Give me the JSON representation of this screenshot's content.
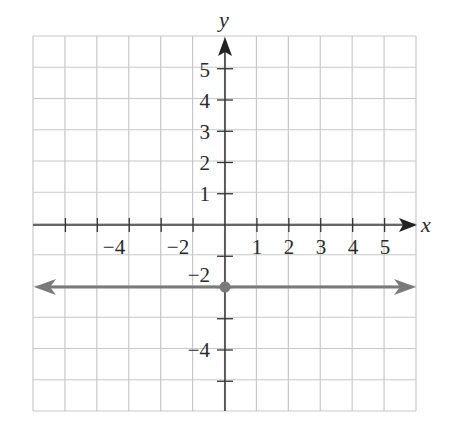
{
  "chart_data": {
    "type": "line",
    "title": "",
    "xlabel": "x",
    "ylabel": "y",
    "xlim": [
      -6,
      6
    ],
    "ylim": [
      -6,
      6
    ],
    "grid": true,
    "x_tick_labels": [
      "-4",
      "-2",
      "1",
      "2",
      "3",
      "4",
      "5"
    ],
    "x_tick_values": [
      -4,
      -2,
      1,
      2,
      3,
      4,
      5
    ],
    "y_tick_labels": [
      "5",
      "4",
      "3",
      "2",
      "1",
      "-2",
      "-4"
    ],
    "y_tick_values": [
      5,
      4,
      3,
      2,
      1,
      -2,
      -4
    ],
    "series": [
      {
        "name": "y = -2",
        "equation": "y = -2",
        "kind": "horizontal line with arrows at both ends",
        "x": [
          -6,
          6
        ],
        "y": [
          -2,
          -2
        ],
        "color": "#7a7a7a"
      }
    ],
    "points": [
      {
        "label": "y-intercept",
        "x": 0,
        "y": -2,
        "color": "#7a7a7a"
      }
    ]
  },
  "labels": {
    "x_axis": "x",
    "y_axis": "y",
    "xticks": [
      "−4",
      "−2",
      "1",
      "2",
      "3",
      "4",
      "5"
    ],
    "yticks": [
      "5",
      "4",
      "3",
      "2",
      "1",
      "−2",
      "−4"
    ]
  },
  "colors": {
    "grid": "#c8c8c8",
    "axis": "#333333",
    "line": "#7a7a7a"
  }
}
